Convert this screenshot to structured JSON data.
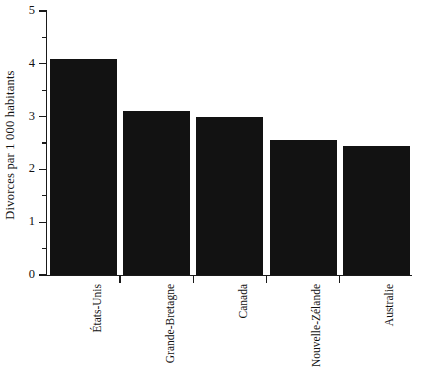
{
  "chart_data": {
    "type": "bar",
    "title": "",
    "subtitle": "",
    "xlabel": "",
    "ylabel": "Divorces par 1 000 habitants",
    "categories": [
      "États-Unis",
      "Grande-Bretagne",
      "Canada",
      "Nouvelle-Zélande",
      "Australie"
    ],
    "values": [
      4.1,
      3.1,
      3.0,
      2.55,
      2.45
    ],
    "series": [
      {
        "name": "Divorces par 1 000 habitants",
        "values": [
          4.1,
          3.1,
          3.0,
          2.55,
          2.45
        ]
      }
    ],
    "ylim": [
      0,
      5
    ],
    "y_major_ticks": [
      0,
      1,
      2,
      3,
      4,
      5
    ],
    "y_minor_ticks": [
      0.5,
      1.5,
      2.5,
      3.5,
      4.5
    ],
    "y_tick_labels": [
      "0",
      "1",
      "2",
      "3",
      "4",
      "5"
    ],
    "grid": false,
    "legend": false,
    "legend_position": "none",
    "bar_color": "#121212",
    "axis_color": "#1a1a1a",
    "background_color": "#ffffff",
    "annotations": []
  },
  "axes": {
    "y_title": "Divorces par 1 000 habitants",
    "ticks": [
      {
        "label": "5",
        "value": 5
      },
      {
        "label": "4",
        "value": 4
      },
      {
        "label": "3",
        "value": 3
      },
      {
        "label": "2",
        "value": 2
      },
      {
        "label": "1",
        "value": 1
      },
      {
        "label": "0",
        "value": 0
      }
    ]
  },
  "bars": [
    {
      "label": "États-Unis",
      "value": 4.1
    },
    {
      "label": "Grande-Bretagne",
      "value": 3.1
    },
    {
      "label": "Canada",
      "value": 3.0
    },
    {
      "label": "Nouvelle-Zélande",
      "value": 2.55
    },
    {
      "label": "Australie",
      "value": 2.45
    }
  ]
}
